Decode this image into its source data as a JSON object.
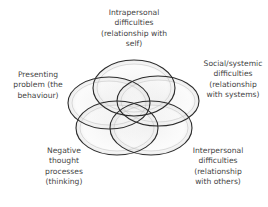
{
  "diagram": {
    "type": "overlapping-ellipses",
    "ellipses": [
      {
        "id": "intrapersonal",
        "cx": 134,
        "cy": 88,
        "rx": 41,
        "ry": 28
      },
      {
        "id": "social",
        "cx": 158,
        "cy": 101,
        "rx": 41,
        "ry": 25
      },
      {
        "id": "presenting",
        "cx": 109,
        "cy": 103,
        "rx": 41,
        "ry": 26
      },
      {
        "id": "negative",
        "cx": 117,
        "cy": 128,
        "rx": 41,
        "ry": 27
      },
      {
        "id": "interpersonal",
        "cx": 151,
        "cy": 128,
        "rx": 41,
        "ry": 27
      }
    ],
    "colors": {
      "stroke": "#2b2b2b",
      "inner_stroke": "#b8b8b8",
      "fill": "#e6e6e6"
    },
    "labels": {
      "intrapersonal": [
        "Intrapersonal",
        "difficulties",
        "(relationship with",
        "self)"
      ],
      "social": [
        "Social/systemic",
        "difficulties",
        "(relationship",
        "with systems)"
      ],
      "presenting": [
        "Presenting",
        "problem (the",
        "behaviour)"
      ],
      "negative": [
        "Negative",
        "thought",
        "processes",
        "(thinking)"
      ],
      "interpersonal": [
        "Interpersonal",
        "difficulties",
        "(relationship",
        "with others)"
      ]
    }
  }
}
